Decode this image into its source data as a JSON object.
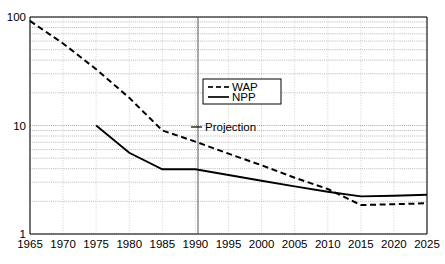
{
  "chart_data": {
    "type": "line",
    "title": "",
    "subtitle": "",
    "xlabel": "",
    "ylabel": "",
    "yscale": "log",
    "ylim": [
      1,
      100
    ],
    "xlim": [
      1965,
      2025
    ],
    "grid": true,
    "grid_style": "dotted-minor-log",
    "legend_position": "upper-center",
    "y_tick_labels": [
      "100",
      "10",
      "1"
    ],
    "y_tick_values": [
      100,
      10,
      1
    ],
    "x_tick_labels": [
      "1965",
      "1970",
      "1975",
      "1980",
      "1985",
      "1990",
      "1995",
      "2000",
      "2005",
      "2010",
      "2015",
      "2020",
      "2025"
    ],
    "x_tick_values": [
      1965,
      1970,
      1975,
      1980,
      1985,
      1990,
      1995,
      2000,
      2005,
      2010,
      2015,
      2020,
      2025
    ],
    "annotations": [
      {
        "name": "projection-marker",
        "text": "Projection",
        "x": 1990,
        "y": 10,
        "line_x": 1990
      }
    ],
    "series": [
      {
        "name": "WAP",
        "style": "dashed",
        "color": "#000000",
        "x": [
          1965,
          1970,
          1975,
          1980,
          1985,
          1990,
          1995,
          2000,
          2005,
          2010,
          2015,
          2020,
          2025
        ],
        "values": [
          92,
          57,
          33,
          18,
          9.0,
          7.1,
          5.5,
          4.3,
          3.3,
          2.6,
          1.85,
          1.88,
          1.92
        ]
      },
      {
        "name": "NPP",
        "style": "solid",
        "color": "#000000",
        "x": [
          1975,
          1980,
          1985,
          1990,
          1995,
          2000,
          2005,
          2010,
          2015,
          2020,
          2025
        ],
        "values": [
          10.0,
          5.6,
          3.95,
          3.95,
          3.5,
          3.1,
          2.75,
          2.45,
          2.22,
          2.25,
          2.3
        ]
      }
    ]
  },
  "legend": {
    "items": [
      {
        "label": "WAP",
        "style": "dashed"
      },
      {
        "label": "NPP",
        "style": "solid"
      }
    ]
  }
}
